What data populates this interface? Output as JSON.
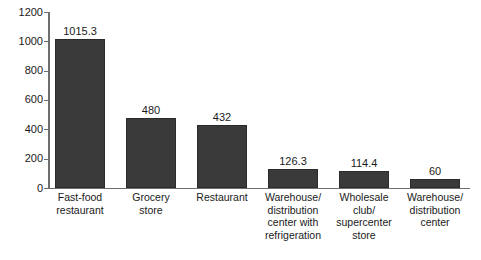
{
  "chart_data": {
    "type": "bar",
    "title": "",
    "subtitle": "",
    "xlabel": "",
    "ylabel": "",
    "ylim": [
      0,
      1200
    ],
    "yticks": [
      0,
      200,
      400,
      600,
      800,
      1000,
      1200
    ],
    "ytick_labels": [
      "0",
      "200",
      "400",
      "600",
      "800",
      "1000",
      "1200"
    ],
    "grid": false,
    "legend": false,
    "legend_position": "none",
    "orientation": "vertical",
    "categories": [
      "Fast-food restaurant",
      "Grocery store",
      "Restaurant",
      "Warehouse/ distribution center with refrigeration",
      "Wholesale club/ supercenter store",
      "Warehouse/ distribution center"
    ],
    "category_lines": [
      [
        "Fast-food",
        "restaurant"
      ],
      [
        "Grocery",
        "store"
      ],
      [
        "Restaurant"
      ],
      [
        "Warehouse/",
        "distribution",
        "center with",
        "refrigeration"
      ],
      [
        "Wholesale",
        "club/",
        "supercenter",
        "store"
      ],
      [
        "Warehouse/",
        "distribution",
        "center"
      ]
    ],
    "values": [
      1015.3,
      480,
      432,
      126.3,
      114.4,
      60
    ],
    "value_labels": [
      "1015.3",
      "480",
      "432",
      "126.3",
      "114.4",
      "60"
    ],
    "colors": {
      "bar_fill": "#3a3a3a",
      "bar_border": "#2b2b2b",
      "axis": "#6e6e6e",
      "text": "#1a1a1a",
      "background": "#ffffff"
    }
  }
}
